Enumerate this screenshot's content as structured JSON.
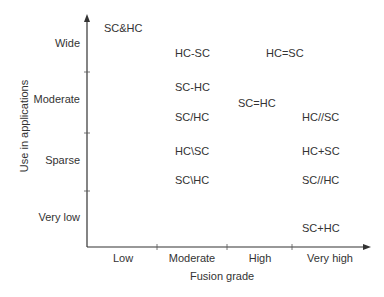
{
  "chart_data": {
    "type": "scatter",
    "title": "",
    "xlabel": "Fusion grade",
    "ylabel": "Use in applications",
    "x_categories": [
      "Low",
      "Moderate",
      "High",
      "Very high"
    ],
    "y_categories": [
      "Very low",
      "Sparse",
      "Moderate",
      "Wide"
    ],
    "grid": false,
    "legend": null,
    "points": [
      {
        "label": "SC&HC",
        "x": "Low",
        "y": "Wide"
      },
      {
        "label": "HC-SC",
        "x": "Moderate",
        "y": "Wide"
      },
      {
        "label": "HC=SC",
        "x": "High",
        "y": "Wide"
      },
      {
        "label": "SC-HC",
        "x": "Moderate",
        "y": "Moderate"
      },
      {
        "label": "SC/HC",
        "x": "Moderate",
        "y": "Moderate"
      },
      {
        "label": "SC=HC",
        "x": "High",
        "y": "Moderate"
      },
      {
        "label": "HC//SC",
        "x": "Very high",
        "y": "Moderate"
      },
      {
        "label": "HC\\SC",
        "x": "Moderate",
        "y": "Sparse"
      },
      {
        "label": "SC\\HC",
        "x": "Moderate",
        "y": "Sparse"
      },
      {
        "label": "HC+SC",
        "x": "Very high",
        "y": "Sparse"
      },
      {
        "label": "SC//HC",
        "x": "Very high",
        "y": "Sparse"
      },
      {
        "label": "SC+HC",
        "x": "Very high",
        "y": "Very low"
      }
    ]
  },
  "axes": {
    "x_title": "Fusion grade",
    "y_title": "Use in applications",
    "x_ticks": [
      "Low",
      "Moderate",
      "High",
      "Very high"
    ],
    "y_ticks": [
      "Wide",
      "Moderate",
      "Sparse",
      "Very low"
    ]
  },
  "labels": [
    {
      "text": "SC&HC",
      "left": 104,
      "top": 22
    },
    {
      "text": "HC-SC",
      "left": 175,
      "top": 47
    },
    {
      "text": "HC=SC",
      "left": 266,
      "top": 47
    },
    {
      "text": "SC-HC",
      "left": 175,
      "top": 81
    },
    {
      "text": "SC=HC",
      "left": 238,
      "top": 97
    },
    {
      "text": "SC/HC",
      "left": 175,
      "top": 111
    },
    {
      "text": "HC//SC",
      "left": 302,
      "top": 111
    },
    {
      "text": "HC\\SC",
      "left": 175,
      "top": 145
    },
    {
      "text": "HC+SC",
      "left": 302,
      "top": 145
    },
    {
      "text": "SC\\HC",
      "left": 175,
      "top": 174
    },
    {
      "text": "SC//HC",
      "left": 302,
      "top": 174
    },
    {
      "text": "SC+HC",
      "left": 302,
      "top": 222
    }
  ],
  "colors": {
    "axis": "#333333",
    "text": "#333333",
    "background": "#ffffff"
  }
}
